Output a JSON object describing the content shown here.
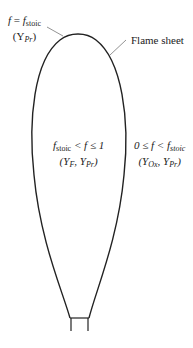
{
  "diagram": {
    "labels": {
      "flame_sheet": "Flame sheet",
      "top": {
        "line1_f": "f",
        "line1_eq": " = ",
        "line1_f2": "f",
        "line1_sub": "stoic",
        "line2": "(Y",
        "line2_sub": "Pr",
        "line2_end": ")"
      },
      "inside": {
        "f": "f",
        "sub": "stoic",
        "rel": " < f ≤ 1",
        "line2": "(Y",
        "line2_sub1": "F",
        "line2_mid": ", Y",
        "line2_sub2": "Pr",
        "line2_end": ")"
      },
      "outside": {
        "pre": "0 ≤ f < f",
        "sub": "stoic",
        "line2": "(Y",
        "line2_sub1": "Ox",
        "line2_mid": ", Y",
        "line2_sub2": "Pr",
        "line2_end": ")"
      }
    },
    "colors": {
      "stroke": "#222222",
      "background": "#ffffff"
    }
  }
}
